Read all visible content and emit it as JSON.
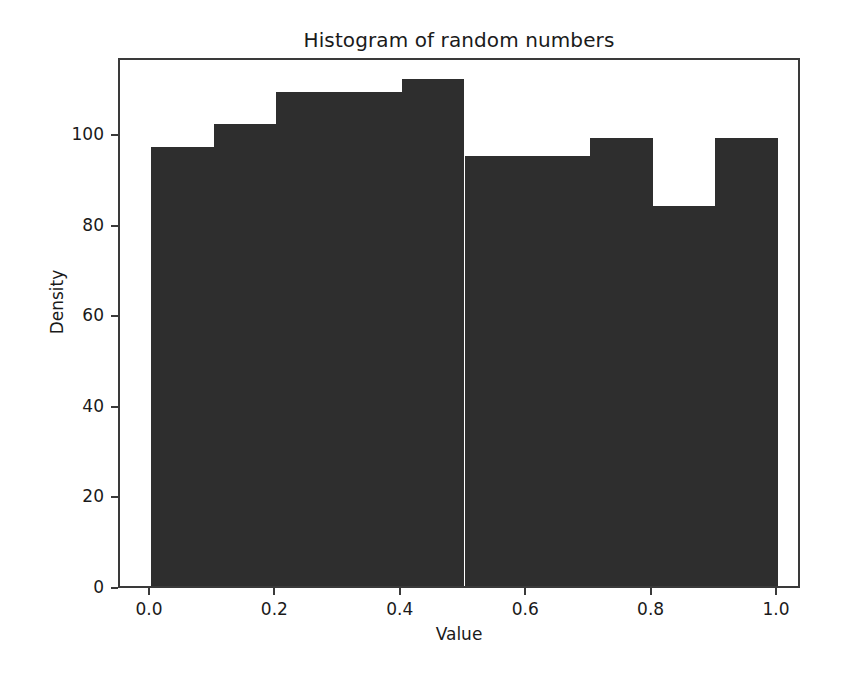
{
  "chart_data": {
    "type": "bar",
    "title": "Histogram of random numbers",
    "xlabel": "Value",
    "ylabel": "Density",
    "xlim": [
      0.0,
      1.0
    ],
    "ylim": [
      0,
      117
    ],
    "grid": false,
    "legend": null,
    "bin_edges": [
      0.0,
      0.1,
      0.2,
      0.3,
      0.4,
      0.5,
      0.6,
      0.7,
      0.8,
      0.9,
      1.0
    ],
    "categories": [
      "0.0-0.1",
      "0.1-0.2",
      "0.2-0.3",
      "0.3-0.4",
      "0.4-0.5",
      "0.5-0.6",
      "0.6-0.7",
      "0.7-0.8",
      "0.8-0.9",
      "0.9-1.0"
    ],
    "values": [
      97,
      102,
      109,
      109,
      112,
      95,
      95,
      99,
      84,
      99
    ],
    "bar_color": "#2e2e2e",
    "xticks": [
      {
        "value": 0.0,
        "label": "0.0"
      },
      {
        "value": 0.2,
        "label": "0.2"
      },
      {
        "value": 0.4,
        "label": "0.4"
      },
      {
        "value": 0.6,
        "label": "0.6"
      },
      {
        "value": 0.8,
        "label": "0.8"
      },
      {
        "value": 1.0,
        "label": "1.0"
      }
    ],
    "yticks": [
      {
        "value": 0,
        "label": "0"
      },
      {
        "value": 20,
        "label": "20"
      },
      {
        "value": 40,
        "label": "40"
      },
      {
        "value": 60,
        "label": "60"
      },
      {
        "value": 80,
        "label": "80"
      },
      {
        "value": 100,
        "label": "100"
      }
    ]
  },
  "figure": {
    "background_color": "#ffffff",
    "frame_color": "#3a3a3a",
    "text_color": "#1a1a1a"
  }
}
